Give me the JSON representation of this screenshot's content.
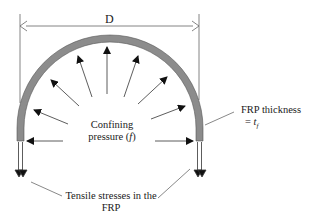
{
  "diagram": {
    "dimension_label": "D",
    "center_label_line1": "Confining",
    "center_label_line2": "pressure (",
    "center_label_var": "f",
    "center_label_close": ")",
    "thickness_label_line1": "FRP thickness",
    "thickness_label_eq": "= ",
    "thickness_label_var": "t",
    "thickness_label_sub": "f",
    "tensile_label_line1": "Tensile stresses in the",
    "tensile_label_line2": "FRP",
    "colors": {
      "shell_fill": "#8c8c8c",
      "line": "#333333",
      "arrow": "#111111"
    }
  }
}
